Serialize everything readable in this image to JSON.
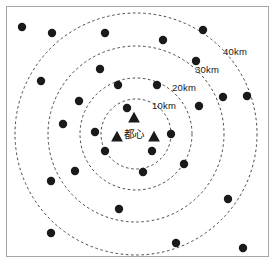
{
  "figure": {
    "name": "concentric-distance-ring-map",
    "background_color": "#ffffff",
    "frame_color": "#a6a6a6",
    "marker_color": "#1a1a1a",
    "ring_color": "#333333",
    "center_label": "都心"
  },
  "rings": [
    {
      "label": "10km",
      "radius_km": 10,
      "radius_px": 35,
      "label_x": 152,
      "label_y": 101
    },
    {
      "label": "20km",
      "radius_km": 20,
      "radius_px": 56,
      "label_x": 172,
      "label_y": 83
    },
    {
      "label": "30km",
      "radius_km": 30,
      "radius_px": 88,
      "label_x": 195,
      "label_y": 65
    },
    {
      "label": "40km",
      "radius_km": 40,
      "radius_px": 121,
      "label_x": 223,
      "label_y": 47
    }
  ],
  "center": {
    "x": 136,
    "y": 134,
    "label": "都心",
    "label_x": 124,
    "label_y": 129
  },
  "triangles": [
    {
      "name": "city-center-marker-north",
      "x": 134,
      "y": 118
    },
    {
      "name": "city-center-marker-west",
      "x": 117,
      "y": 137
    },
    {
      "name": "city-center-marker-east",
      "x": 154,
      "y": 137
    }
  ],
  "dots": [
    {
      "x": 22,
      "y": 27
    },
    {
      "x": 52,
      "y": 33
    },
    {
      "x": 105,
      "y": 33
    },
    {
      "x": 163,
      "y": 40
    },
    {
      "x": 203,
      "y": 30
    },
    {
      "x": 41,
      "y": 81
    },
    {
      "x": 100,
      "y": 69
    },
    {
      "x": 196,
      "y": 61
    },
    {
      "x": 118,
      "y": 85
    },
    {
      "x": 157,
      "y": 85
    },
    {
      "x": 79,
      "y": 101
    },
    {
      "x": 127,
      "y": 108
    },
    {
      "x": 223,
      "y": 97
    },
    {
      "x": 247,
      "y": 96
    },
    {
      "x": 63,
      "y": 124
    },
    {
      "x": 199,
      "y": 106
    },
    {
      "x": 95,
      "y": 132
    },
    {
      "x": 171,
      "y": 134
    },
    {
      "x": 105,
      "y": 151
    },
    {
      "x": 152,
      "y": 151
    },
    {
      "x": 75,
      "y": 171
    },
    {
      "x": 143,
      "y": 172
    },
    {
      "x": 51,
      "y": 181
    },
    {
      "x": 184,
      "y": 164
    },
    {
      "x": 228,
      "y": 199
    },
    {
      "x": 119,
      "y": 209
    },
    {
      "x": 51,
      "y": 233
    },
    {
      "x": 176,
      "y": 243
    },
    {
      "x": 243,
      "y": 248
    }
  ]
}
